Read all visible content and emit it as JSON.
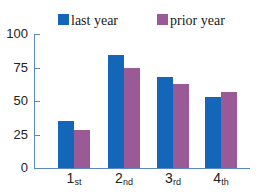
{
  "legend": [
    {
      "label": "last year",
      "color": "#1466b8"
    },
    {
      "label": "prior year",
      "color": "#9a5a98"
    }
  ],
  "axis": {
    "color": "#5b86c0"
  },
  "chart_data": {
    "type": "bar",
    "title": "",
    "categories": [
      "1st",
      "2nd",
      "3rd",
      "4th"
    ],
    "category_labels": [
      {
        "num": "1",
        "suffix": "st"
      },
      {
        "num": "2",
        "suffix": "nd"
      },
      {
        "num": "3",
        "suffix": "rd"
      },
      {
        "num": "4",
        "suffix": "th"
      }
    ],
    "series": [
      {
        "name": "last year",
        "values": [
          35,
          84,
          68,
          53
        ]
      },
      {
        "name": "prior year",
        "values": [
          28,
          75,
          63,
          57
        ]
      }
    ],
    "xlabel": "",
    "ylabel": "",
    "ylim": [
      0,
      100
    ],
    "yticks": [
      "0",
      "25",
      "50",
      "75",
      "100"
    ],
    "grid": false,
    "legend_position": "top"
  }
}
